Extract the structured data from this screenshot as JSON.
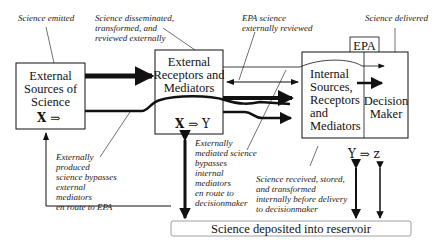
{
  "boxes": {
    "external_sources": {
      "lines": [
        "External",
        "Sources of",
        "Science"
      ],
      "formula_bold": "X",
      "formula_rest": " ⇒"
    },
    "external_receptors": {
      "lines": [
        "External",
        "Receptors and",
        "Mediators"
      ],
      "formula_bold": "X",
      "formula_rest": " ⇒ Y"
    },
    "epa_label": "EPA",
    "internal": {
      "lines": [
        "Internal",
        "Sources,",
        "Receptors",
        "and",
        "Mediators"
      ]
    },
    "decision_maker": {
      "lines": [
        "Decision",
        "Maker"
      ]
    },
    "epa_formula": "Y ⇒ z",
    "reservoir": "Science deposited into reservoir"
  },
  "annotations": {
    "science_emitted": [
      "Science emitted"
    ],
    "disseminated": [
      "Science disseminated,",
      "transformed, and",
      "reviewed externally"
    ],
    "epa_reviewed": [
      "EPA science",
      "externally reviewed"
    ],
    "science_delivered": [
      "Science delivered"
    ],
    "bypass_external": [
      "Externally",
      "produced",
      "science bypasses",
      "external",
      "mediators",
      "en route to EPA"
    ],
    "bypass_internal": [
      "Externally",
      "mediated science",
      "bypasses",
      "internal",
      "mediators",
      "en route to",
      "decisionmaker"
    ],
    "received_internal": [
      "Science received, stored,",
      "and transformed",
      "internally before delivery",
      "to decisionmaker"
    ]
  }
}
